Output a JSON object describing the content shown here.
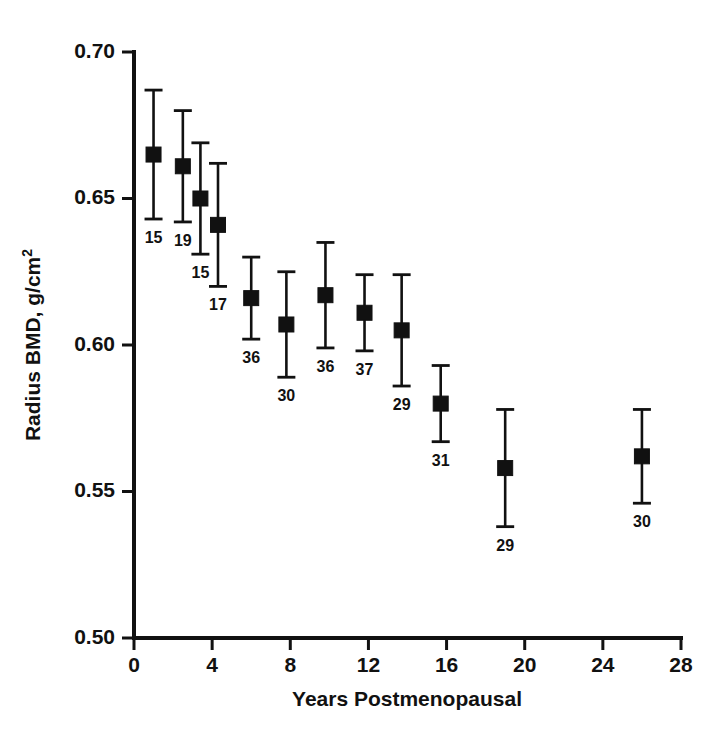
{
  "chart_data": {
    "type": "scatter",
    "title": "",
    "xlabel": "Years Postmenopausal",
    "ylabel": "Radius BMD, g/cm2",
    "ylabel_main": "Radius BMD, g/cm",
    "ylabel_sup": "2",
    "xlim": [
      0,
      28
    ],
    "ylim": [
      0.5,
      0.7
    ],
    "xticks": [
      0,
      4,
      8,
      12,
      16,
      20,
      24,
      28
    ],
    "xticklabels": [
      "0",
      "4",
      "8",
      "12",
      "16",
      "20",
      "24",
      "28"
    ],
    "yticks": [
      0.5,
      0.55,
      0.6,
      0.65,
      0.7
    ],
    "yticklabels": [
      "0.50",
      "0.55",
      "0.60",
      "0.65",
      "0.70"
    ],
    "grid": false,
    "legend": "none",
    "errorbar_type": "symmetric",
    "marker": "filled-square",
    "series_name": "Radius BMD by years postmenopausal",
    "points": [
      {
        "x": 1.0,
        "y": 0.665,
        "err": 0.022,
        "n": "15"
      },
      {
        "x": 2.5,
        "y": 0.661,
        "err": 0.019,
        "n": "19"
      },
      {
        "x": 3.4,
        "y": 0.65,
        "err": 0.019,
        "n": "15"
      },
      {
        "x": 4.3,
        "y": 0.641,
        "err": 0.021,
        "n": "17"
      },
      {
        "x": 6.0,
        "y": 0.616,
        "err": 0.014,
        "n": "36"
      },
      {
        "x": 7.8,
        "y": 0.607,
        "err": 0.018,
        "n": "30"
      },
      {
        "x": 9.8,
        "y": 0.617,
        "err": 0.018,
        "n": "36"
      },
      {
        "x": 11.8,
        "y": 0.611,
        "err": 0.013,
        "n": "37"
      },
      {
        "x": 13.7,
        "y": 0.605,
        "err": 0.019,
        "n": "29"
      },
      {
        "x": 15.7,
        "y": 0.58,
        "err": 0.013,
        "n": "31"
      },
      {
        "x": 19.0,
        "y": 0.558,
        "err": 0.02,
        "n": "29"
      },
      {
        "x": 26.0,
        "y": 0.562,
        "err": 0.016,
        "n": "30"
      }
    ]
  },
  "colors": {
    "ink": "#111111",
    "background": "#ffffff"
  }
}
